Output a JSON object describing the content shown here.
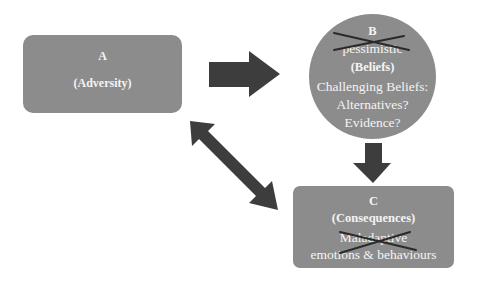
{
  "diagram": {
    "type": "ABC model flow diagram",
    "colors": {
      "node_fill": "#8c8c8c",
      "node_text": "#f4f4f4",
      "arrow": "#3d3d3d",
      "cross_mark": "#2a2a2a"
    },
    "node_a": {
      "letter": "A",
      "label": "(Adversity)"
    },
    "node_b": {
      "letter": "B",
      "crossed_word": "pessimistic",
      "label": "(Beliefs)",
      "challenge_lines": [
        "Challenging Beliefs:",
        "Alternatives?",
        "Evidence?"
      ]
    },
    "node_c": {
      "letter": "C",
      "label": "(Consequences)",
      "crossed_word": "Maladaptive",
      "detail": "emotions & behaviours"
    },
    "edges": [
      {
        "from": "A",
        "to": "B",
        "style": "right-arrow"
      },
      {
        "from": "B",
        "to": "C",
        "style": "down-arrow"
      },
      {
        "from": "A",
        "to": "C",
        "style": "double-headed-arrow"
      }
    ]
  }
}
